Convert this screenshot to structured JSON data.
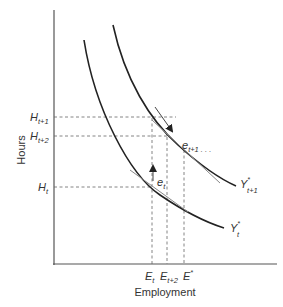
{
  "diagram": {
    "x_axis_label": "Employment",
    "y_axis_label": "Hours",
    "y_ticks": [
      {
        "main": "H",
        "sub": "t+1"
      },
      {
        "main": "H",
        "sub": "t+2"
      },
      {
        "main": "H",
        "sub": "t"
      }
    ],
    "x_ticks": [
      {
        "main": "E",
        "sub": "t"
      },
      {
        "main": "E",
        "sub": "t+2"
      },
      {
        "main": "E",
        "sup": "*"
      }
    ],
    "curves": [
      {
        "main": "Y",
        "sup": "*",
        "sub": "t+1"
      },
      {
        "main": "Y",
        "sup": "*",
        "sub": "t"
      }
    ],
    "points": [
      {
        "main": "e",
        "sub": "t"
      },
      {
        "main": "e",
        "sub": "t+1",
        "suffix": " . . ."
      }
    ],
    "colors": {
      "line": "#333333",
      "dashed": "#666666",
      "tangent": "#888888"
    }
  }
}
